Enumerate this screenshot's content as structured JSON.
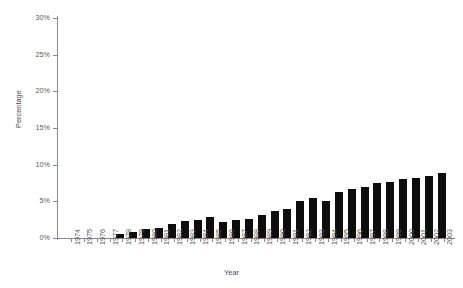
{
  "chart_data": {
    "type": "bar",
    "title": "",
    "xlabel": "Year",
    "ylabel": "Percentage",
    "ylim": [
      0,
      30
    ],
    "yticks": [
      0,
      5,
      10,
      15,
      20,
      25,
      30
    ],
    "ytick_labels": [
      "0%",
      "5%",
      "10%",
      "15%",
      "20%",
      "25%",
      "30%"
    ],
    "grid": false,
    "legend": "none",
    "bar_color": "#0d0d0d",
    "axis_color": "#8a8a8a",
    "categories": [
      "1974",
      "1975",
      "1976",
      "1977",
      "1978",
      "1979",
      "1980",
      "1981",
      "1982",
      "1983",
      "1984",
      "1985",
      "1986",
      "1987",
      "1988",
      "1989",
      "1990",
      "1991",
      "1992",
      "1993",
      "1994",
      "1995",
      "1996",
      "1997",
      "1998",
      "1999",
      "2000",
      "2001",
      "2002",
      "2003"
    ],
    "values": [
      0,
      0,
      0,
      0,
      0.5,
      0.8,
      1.2,
      1.4,
      1.9,
      2.3,
      2.5,
      2.8,
      2.2,
      2.4,
      2.6,
      3.1,
      3.7,
      4.0,
      5.0,
      5.4,
      5.1,
      6.3,
      6.7,
      7.0,
      7.5,
      7.7,
      8.0,
      8.2,
      8.5,
      8.9
    ],
    "value_unit": "%"
  }
}
